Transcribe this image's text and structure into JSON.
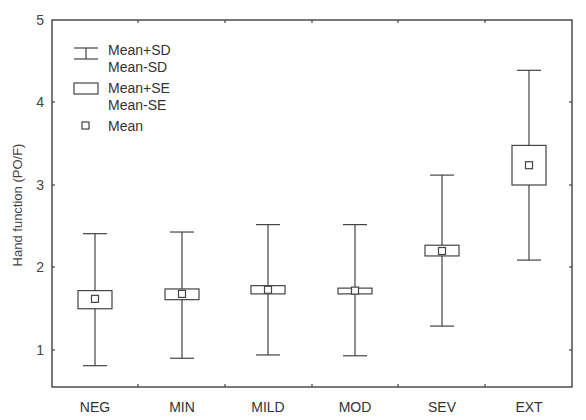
{
  "chart_data": {
    "type": "box",
    "title": "",
    "xlabel": "",
    "ylabel": "Hand function (PO/F)",
    "ylim": [
      0.5,
      5
    ],
    "yticks": [
      1,
      2,
      3,
      4,
      5
    ],
    "grid": false,
    "legend_position": "upper-left (inside)",
    "legend": [
      {
        "symbol": "whisker",
        "label": "Mean+SD",
        "label2": "Mean-SD"
      },
      {
        "symbol": "box",
        "label": "Mean+SE",
        "label2": "Mean-SE"
      },
      {
        "symbol": "small-square",
        "label": "Mean"
      }
    ],
    "categories": [
      "NEG",
      "MIN",
      "MILD",
      "MOD",
      "SEV",
      "EXT"
    ],
    "series": [
      {
        "name": "Mean",
        "values": [
          1.62,
          1.68,
          1.73,
          1.72,
          2.2,
          3.24
        ]
      },
      {
        "name": "Mean+SE",
        "values": [
          1.72,
          1.74,
          1.78,
          1.75,
          2.27,
          3.48
        ]
      },
      {
        "name": "Mean-SE",
        "values": [
          1.5,
          1.61,
          1.68,
          1.68,
          2.14,
          3.0
        ]
      },
      {
        "name": "Mean+SD",
        "values": [
          2.41,
          2.43,
          2.52,
          2.52,
          3.12,
          4.39
        ]
      },
      {
        "name": "Mean-SD",
        "values": [
          0.81,
          0.9,
          0.94,
          0.93,
          1.29,
          2.09
        ]
      }
    ]
  },
  "labels": {
    "ylabel": "Hand function (PO/F)",
    "yticks": [
      "1",
      "2",
      "3",
      "4",
      "5"
    ],
    "categories": [
      "NEG",
      "MIN",
      "MILD",
      "MOD",
      "SEV",
      "EXT"
    ],
    "legend": {
      "sd_top": "Mean+SD",
      "sd_bottom": "Mean-SD",
      "se_top": "Mean+SE",
      "se_bottom": "Mean-SE",
      "mean": "Mean"
    }
  }
}
